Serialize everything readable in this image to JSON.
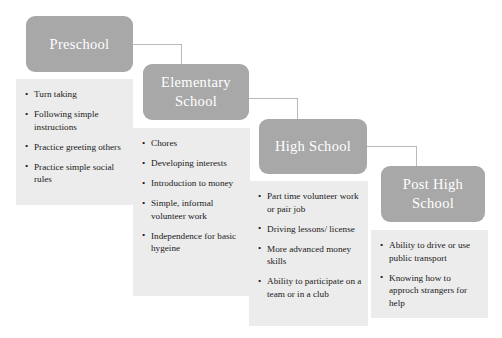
{
  "diagram": {
    "type": "flowchart-cascade",
    "colors": {
      "header_fill": "#a8a8a8",
      "header_text": "#ffffff",
      "body_fill": "#ececec",
      "body_text": "#1a1a1a",
      "connector": "#b9b9b9",
      "background": "#ffffff"
    },
    "bullet_glyph": "•",
    "stages": [
      {
        "id": "preschool",
        "header": "Preschool",
        "items": [
          "Turn taking",
          "Following simple instructions",
          "Practice greeting others",
          "Practice simple social rules"
        ]
      },
      {
        "id": "elementary-school",
        "header": "Elementary School",
        "items": [
          "Chores",
          "Developing interests",
          "Introduction to money",
          "Simple, informal volunteer work",
          "Independence for basic hygeine"
        ]
      },
      {
        "id": "high-school",
        "header": "High School",
        "items": [
          "Part time volunteer work or pair job",
          "Driving lessons/ license",
          "More advanced money skills",
          "Ability to participate on a team or in a club"
        ]
      },
      {
        "id": "post-high-school",
        "header": "Post High School",
        "items": [
          "Ability to drive or use public transport",
          "Knowing how to approch strangers for help"
        ]
      }
    ],
    "connectors": [
      {
        "from": "preschool",
        "to": "elementary-school"
      },
      {
        "from": "elementary-school",
        "to": "high-school"
      },
      {
        "from": "high-school",
        "to": "post-high-school"
      }
    ]
  }
}
